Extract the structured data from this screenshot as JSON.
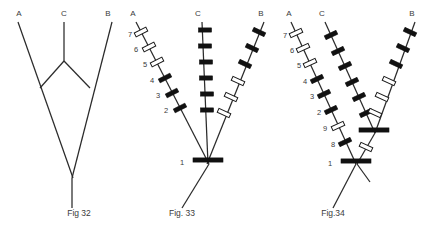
{
  "page": {
    "background": "#ffffff",
    "line_color": "#2b2b2b",
    "band_black": "#111111",
    "band_white": "#ffffff",
    "text_color": "#3a3a3a",
    "width": 435,
    "height": 234
  },
  "figures": [
    {
      "id": "fig32",
      "caption": "Fig 32",
      "caption_x": 79,
      "caption_y": 216,
      "arm_labels": [
        {
          "text": "A",
          "x": 19,
          "y": 16
        },
        {
          "text": "C",
          "x": 64,
          "y": 16
        },
        {
          "text": "B",
          "x": 108,
          "y": 16
        }
      ],
      "paths": [
        {
          "name": "arm-a",
          "d": "M 18 22 L 73 178"
        },
        {
          "name": "arm-b",
          "d": "M 112 22 L 72 178"
        },
        {
          "name": "arm-c",
          "d": "M 64 22 L 64 61"
        },
        {
          "name": "link-c-a",
          "d": "M 64 61 L 40 88"
        },
        {
          "name": "link-c-b",
          "d": "M 64 61 L 90 88"
        },
        {
          "name": "stem",
          "d": "M 72 178 L 72 208"
        }
      ],
      "bands": []
    },
    {
      "id": "fig33",
      "caption": "Fig. 33",
      "caption_x": 182,
      "caption_y": 216,
      "arm_labels": [
        {
          "text": "A",
          "x": 133,
          "y": 16
        },
        {
          "text": "C",
          "x": 198,
          "y": 16
        },
        {
          "text": "B",
          "x": 261,
          "y": 16
        }
      ],
      "paths": [
        {
          "name": "arm-a",
          "d": "M 136 22 L 209 164"
        },
        {
          "name": "arm-c",
          "d": "M 202 22 L 208 164"
        },
        {
          "name": "arm-b",
          "d": "M 264 22 L 207 164"
        },
        {
          "name": "stem",
          "d": "M 209 164 L 182 208"
        }
      ],
      "bands": [
        {
          "arm": "a",
          "x": 141,
          "y": 32,
          "angle": 63,
          "type": "white",
          "label": "7",
          "lx": 130,
          "ly": 34
        },
        {
          "arm": "a",
          "x": 149,
          "y": 47,
          "angle": 63,
          "type": "white",
          "label": "6",
          "lx": 136,
          "ly": 49
        },
        {
          "arm": "a",
          "x": 157,
          "y": 62,
          "angle": 63,
          "type": "white",
          "label": "5",
          "lx": 145,
          "ly": 64
        },
        {
          "arm": "a",
          "x": 165,
          "y": 78,
          "angle": 63,
          "type": "black",
          "label": "4",
          "lx": 152,
          "ly": 80
        },
        {
          "arm": "a",
          "x": 172,
          "y": 93,
          "angle": 63,
          "type": "black",
          "label": "3",
          "lx": 158,
          "ly": 95
        },
        {
          "arm": "a",
          "x": 180,
          "y": 108,
          "angle": 63,
          "type": "black",
          "label": "2",
          "lx": 166,
          "ly": 110
        },
        {
          "arm": "c",
          "x": 205,
          "y": 30,
          "angle": 90,
          "type": "black",
          "label": "",
          "lx": 0,
          "ly": 0
        },
        {
          "arm": "c",
          "x": 205,
          "y": 46,
          "angle": 90,
          "type": "black",
          "label": "",
          "lx": 0,
          "ly": 0
        },
        {
          "arm": "c",
          "x": 206,
          "y": 62,
          "angle": 90,
          "type": "black",
          "label": "",
          "lx": 0,
          "ly": 0
        },
        {
          "arm": "c",
          "x": 206,
          "y": 78,
          "angle": 90,
          "type": "black",
          "label": "",
          "lx": 0,
          "ly": 0
        },
        {
          "arm": "c",
          "x": 207,
          "y": 94,
          "angle": 90,
          "type": "black",
          "label": "",
          "lx": 0,
          "ly": 0
        },
        {
          "arm": "c",
          "x": 207,
          "y": 110,
          "angle": 90,
          "type": "black",
          "label": "",
          "lx": 0,
          "ly": 0
        },
        {
          "arm": "b",
          "x": 259,
          "y": 32,
          "angle": 115,
          "type": "black",
          "label": "",
          "lx": 0,
          "ly": 0
        },
        {
          "arm": "b",
          "x": 252,
          "y": 48,
          "angle": 115,
          "type": "black",
          "label": "",
          "lx": 0,
          "ly": 0
        },
        {
          "arm": "b",
          "x": 245,
          "y": 64,
          "angle": 115,
          "type": "black",
          "label": "",
          "lx": 0,
          "ly": 0
        },
        {
          "arm": "b",
          "x": 238,
          "y": 81,
          "angle": 115,
          "type": "white",
          "label": "",
          "lx": 0,
          "ly": 0
        },
        {
          "arm": "b",
          "x": 231,
          "y": 97,
          "angle": 115,
          "type": "white",
          "label": "",
          "lx": 0,
          "ly": 0
        },
        {
          "arm": "b",
          "x": 224,
          "y": 113,
          "angle": 115,
          "type": "white",
          "label": "",
          "lx": 0,
          "ly": 0
        },
        {
          "arm": "root",
          "x": 208,
          "y": 160,
          "angle": 90,
          "type": "black",
          "label": "1",
          "lx": 182,
          "ly": 162,
          "wide": true
        }
      ]
    },
    {
      "id": "fig34",
      "caption": "Fig.34",
      "caption_x": 333,
      "caption_y": 216,
      "arm_labels": [
        {
          "text": "A",
          "x": 289,
          "y": 16
        },
        {
          "text": "C",
          "x": 322,
          "y": 16
        },
        {
          "text": "B",
          "x": 412,
          "y": 16
        }
      ],
      "paths": [
        {
          "name": "arm-a",
          "d": "M 291 22 L 356 164"
        },
        {
          "name": "arm-c",
          "d": "M 325 22 L 375 133"
        },
        {
          "name": "arm-b",
          "d": "M 415 22 L 375 133"
        },
        {
          "name": "link-mid",
          "d": "M 375 133 L 357 164"
        },
        {
          "name": "stem",
          "d": "M 356 164 L 333 208"
        },
        {
          "name": "stem2",
          "d": "M 357 164 L 370 182"
        }
      ],
      "bands": [
        {
          "arm": "a",
          "x": 296,
          "y": 33,
          "angle": 65,
          "type": "white",
          "label": "7",
          "lx": 285,
          "ly": 35
        },
        {
          "arm": "a",
          "x": 303,
          "y": 48,
          "angle": 65,
          "type": "white",
          "label": "6",
          "lx": 292,
          "ly": 50
        },
        {
          "arm": "a",
          "x": 310,
          "y": 63,
          "angle": 65,
          "type": "white",
          "label": "5",
          "lx": 299,
          "ly": 65
        },
        {
          "arm": "a",
          "x": 317,
          "y": 79,
          "angle": 65,
          "type": "black",
          "label": "4",
          "lx": 305,
          "ly": 81
        },
        {
          "arm": "a",
          "x": 324,
          "y": 94,
          "angle": 65,
          "type": "black",
          "label": "3",
          "lx": 312,
          "ly": 96
        },
        {
          "arm": "a",
          "x": 331,
          "y": 110,
          "angle": 65,
          "type": "black",
          "label": "2",
          "lx": 319,
          "ly": 112
        },
        {
          "arm": "a",
          "x": 338,
          "y": 126,
          "angle": 65,
          "type": "white",
          "label": "9",
          "lx": 325,
          "ly": 128
        },
        {
          "arm": "a",
          "x": 345,
          "y": 142,
          "angle": 65,
          "type": "black",
          "label": "8",
          "lx": 333,
          "ly": 144
        },
        {
          "arm": "c",
          "x": 331,
          "y": 35,
          "angle": 65,
          "type": "black",
          "label": "",
          "lx": 0,
          "ly": 0
        },
        {
          "arm": "c",
          "x": 338,
          "y": 51,
          "angle": 65,
          "type": "black",
          "label": "",
          "lx": 0,
          "ly": 0
        },
        {
          "arm": "c",
          "x": 345,
          "y": 66,
          "angle": 65,
          "type": "black",
          "label": "",
          "lx": 0,
          "ly": 0
        },
        {
          "arm": "c",
          "x": 352,
          "y": 82,
          "angle": 65,
          "type": "black",
          "label": "",
          "lx": 0,
          "ly": 0
        },
        {
          "arm": "c",
          "x": 359,
          "y": 97,
          "angle": 65,
          "type": "black",
          "label": "",
          "lx": 0,
          "ly": 0
        },
        {
          "arm": "c",
          "x": 366,
          "y": 113,
          "angle": 65,
          "type": "black",
          "label": "",
          "lx": 0,
          "ly": 0
        },
        {
          "arm": "b",
          "x": 410,
          "y": 32,
          "angle": 115,
          "type": "black",
          "label": "",
          "lx": 0,
          "ly": 0
        },
        {
          "arm": "b",
          "x": 403,
          "y": 48,
          "angle": 115,
          "type": "black",
          "label": "",
          "lx": 0,
          "ly": 0
        },
        {
          "arm": "b",
          "x": 396,
          "y": 64,
          "angle": 115,
          "type": "black",
          "label": "",
          "lx": 0,
          "ly": 0
        },
        {
          "arm": "b",
          "x": 389,
          "y": 81,
          "angle": 115,
          "type": "white",
          "label": "",
          "lx": 0,
          "ly": 0
        },
        {
          "arm": "b",
          "x": 382,
          "y": 97,
          "angle": 115,
          "type": "white",
          "label": "",
          "lx": 0,
          "ly": 0
        },
        {
          "arm": "b",
          "x": 375,
          "y": 113,
          "angle": 115,
          "type": "white",
          "label": "",
          "lx": 0,
          "ly": 0
        },
        {
          "arm": "mid",
          "x": 374,
          "y": 130,
          "angle": 90,
          "type": "black",
          "label": "",
          "lx": 0,
          "ly": 0,
          "wide": true
        },
        {
          "arm": "mid",
          "x": 366,
          "y": 147,
          "angle": 115,
          "type": "white",
          "label": "",
          "lx": 0,
          "ly": 0
        },
        {
          "arm": "root",
          "x": 356,
          "y": 161,
          "angle": 90,
          "type": "black",
          "label": "1",
          "lx": 330,
          "ly": 163,
          "wide": true
        }
      ]
    }
  ]
}
